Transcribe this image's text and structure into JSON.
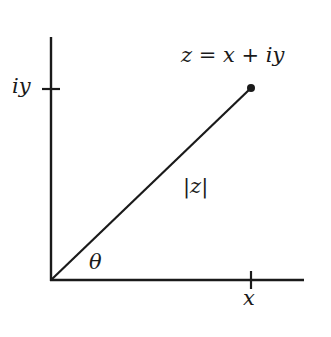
{
  "diagram": {
    "point_label": "z = x + iy",
    "modulus_label": "|z|",
    "angle_label": "θ",
    "x_tick_label": "x",
    "y_tick_label": "iy",
    "colors": {
      "stroke": "#1a1a1a",
      "background": "#ffffff"
    }
  }
}
